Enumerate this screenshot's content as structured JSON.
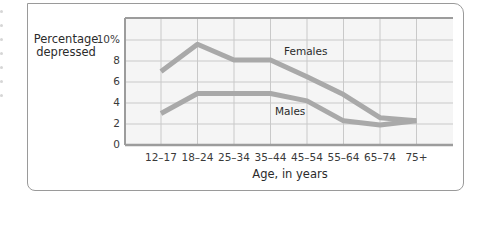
{
  "chart_data": {
    "type": "line",
    "title": "",
    "xlabel": "Age, in years",
    "ylabel": "Percentage depressed",
    "categories": [
      "12–17",
      "18–24",
      "25–34",
      "35–44",
      "45–54",
      "55–64",
      "65–74",
      "75+"
    ],
    "series": [
      {
        "name": "Females",
        "values": [
          7.0,
          9.6,
          8.1,
          8.1,
          6.5,
          4.8,
          2.6,
          2.3
        ]
      },
      {
        "name": "Males",
        "values": [
          3.0,
          4.9,
          4.9,
          4.9,
          4.2,
          2.3,
          1.9,
          2.3
        ]
      }
    ],
    "yticks": [
      "0",
      "2",
      "4",
      "6",
      "8",
      "10%"
    ],
    "ylim": [
      0,
      10
    ],
    "grid": true,
    "legend": "inline labels"
  },
  "labels": {
    "ylabel_line1": "Percentage",
    "ylabel_line2": "depressed",
    "xlabel": "Age, in years",
    "females": "Females",
    "males": "Males"
  },
  "colors": {
    "line": "#a9a9a9",
    "grid": "#c9c9c9",
    "plot_bg": "#f5f5f5",
    "axis": "#9c9c9c"
  }
}
